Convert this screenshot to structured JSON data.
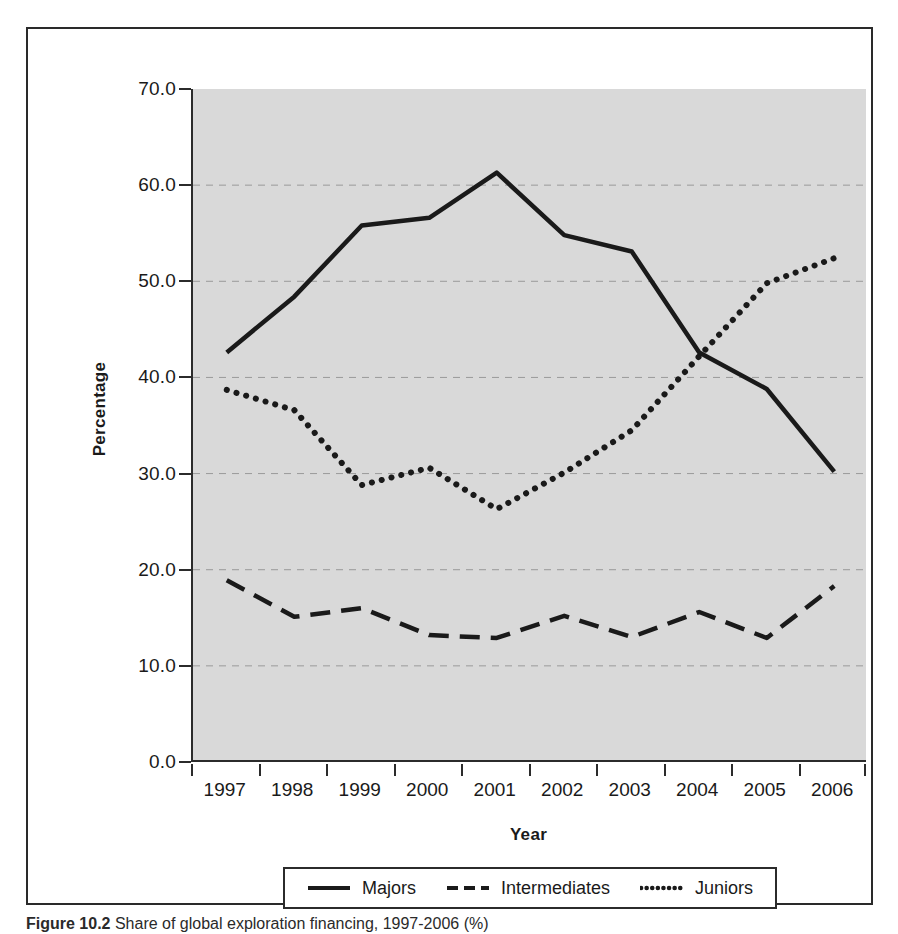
{
  "figure": {
    "caption_label": "Figure 10.2",
    "caption_text": "Share of global exploration financing, 1997-2006 (%)"
  },
  "axes": {
    "y_label": "Percentage",
    "x_label": "Year",
    "y_ticks": [
      "0.0",
      "10.0",
      "20.0",
      "30.0",
      "40.0",
      "50.0",
      "60.0",
      "70.0"
    ],
    "x_ticks": [
      "1997",
      "1998",
      "1999",
      "2000",
      "2001",
      "2002",
      "2003",
      "2004",
      "2005",
      "2006"
    ]
  },
  "legend": {
    "items": [
      {
        "label": "Majors",
        "style": "solid"
      },
      {
        "label": "Intermediates",
        "style": "dashed"
      },
      {
        "label": "Juniors",
        "style": "dotted"
      }
    ]
  },
  "colors": {
    "plot_background": "#d9d9d9",
    "line": "#1a1a1a",
    "gridline": "#9a9a9a",
    "frame": "#2a2a2a"
  },
  "chart_data": {
    "type": "line",
    "title": "Share of global exploration financing, 1997-2006 (%)",
    "xlabel": "Year",
    "ylabel": "Percentage",
    "x": [
      1997,
      1998,
      1999,
      2000,
      2001,
      2002,
      2003,
      2004,
      2005,
      2006
    ],
    "categories": [
      "1997",
      "1998",
      "1999",
      "2000",
      "2001",
      "2002",
      "2003",
      "2004",
      "2005",
      "2006"
    ],
    "ylim": [
      0.0,
      70.0
    ],
    "xlim": [
      1997,
      2006
    ],
    "y_tick_step": 10.0,
    "grid": "horizontal-dashed",
    "legend_position": "bottom",
    "series": [
      {
        "name": "Majors",
        "style": "solid",
        "values": [
          42.6,
          48.4,
          55.8,
          56.6,
          61.3,
          54.8,
          53.1,
          42.6,
          38.8,
          30.2
        ]
      },
      {
        "name": "Intermediates",
        "style": "dashed",
        "values": [
          18.9,
          15.1,
          16.0,
          13.2,
          12.9,
          15.2,
          13.0,
          15.6,
          12.9,
          18.3
        ]
      },
      {
        "name": "Juniors",
        "style": "dotted",
        "values": [
          38.7,
          36.6,
          28.8,
          30.6,
          26.3,
          30.1,
          34.5,
          42.2,
          49.8,
          52.4
        ]
      }
    ]
  }
}
